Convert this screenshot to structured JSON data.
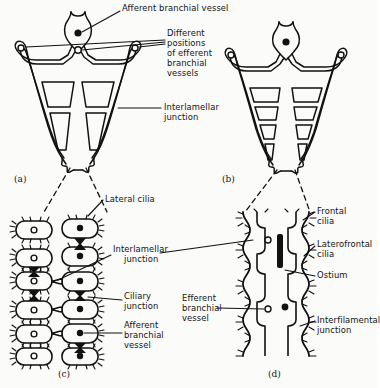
{
  "figure": {
    "title_present": false,
    "background_color": "#fbfbfa",
    "ink_color": "#111111"
  },
  "panels": [
    {
      "id": "a",
      "label": "(a)",
      "x": 14,
      "y": 174,
      "type": "w-shaped-filament",
      "openings_per_side": 2
    },
    {
      "id": "b",
      "label": "(b)",
      "x": 222,
      "y": 174,
      "type": "w-shaped-filament",
      "openings_per_side": 4
    },
    {
      "id": "c",
      "label": "(c)",
      "x": 58,
      "y": 369,
      "type": "ciliated-cell-detail"
    },
    {
      "id": "d",
      "label": "(d)",
      "x": 268,
      "y": 369,
      "type": "ciliated-cell-detail"
    }
  ],
  "labels": [
    {
      "name": "afferent-branchial-vessel-top",
      "lines": [
        "Afferent branchial vessel"
      ],
      "x": 122,
      "y": 5,
      "align": "left"
    },
    {
      "name": "different-positions-efferent",
      "lines": [
        "Different",
        "positions",
        "of efferent",
        "branchial",
        "vessels"
      ],
      "x": 167,
      "y": 30,
      "align": "left"
    },
    {
      "name": "interlamellar-junction-top",
      "lines": [
        "Interlamellar",
        "junction"
      ],
      "x": 163,
      "y": 104,
      "align": "left"
    },
    {
      "name": "lateral-cilia",
      "lines": [
        "Lateral cilia"
      ],
      "x": 105,
      "y": 196,
      "align": "left"
    },
    {
      "name": "interlamellar-junction-mid",
      "lines": [
        "Interlamellar",
        "junction"
      ],
      "x": 113,
      "y": 246,
      "align": "left"
    },
    {
      "name": "ciliary-junction",
      "lines": [
        "Ciliary",
        "junction"
      ],
      "x": 124,
      "y": 293,
      "align": "left"
    },
    {
      "name": "afferent-branchial-vessel-c",
      "lines": [
        "Afferent",
        "branchial",
        "vessel"
      ],
      "x": 124,
      "y": 322,
      "align": "left"
    },
    {
      "name": "efferent-branchial-vessel-d",
      "lines": [
        "Efferent",
        "branchial",
        "vessel"
      ],
      "x": 182,
      "y": 295,
      "align": "left"
    },
    {
      "name": "frontal-cilia",
      "lines": [
        "Frontal",
        "cilia"
      ],
      "x": 317,
      "y": 208,
      "align": "left"
    },
    {
      "name": "laterofrontal-cilia",
      "lines": [
        "Laterofrontal",
        "cilia"
      ],
      "x": 317,
      "y": 241,
      "align": "left"
    },
    {
      "name": "ostium",
      "lines": [
        "Ostium"
      ],
      "x": 317,
      "y": 272,
      "align": "left"
    },
    {
      "name": "interfilamental-junction",
      "lines": [
        "Interfilamental",
        "junction"
      ],
      "x": 317,
      "y": 317,
      "align": "left"
    }
  ],
  "markers": {
    "filled_circle_meaning": "afferent branchial vessel",
    "open_circle_meaning": "efferent branchial vessel",
    "black_bar_meaning": "ostium"
  }
}
